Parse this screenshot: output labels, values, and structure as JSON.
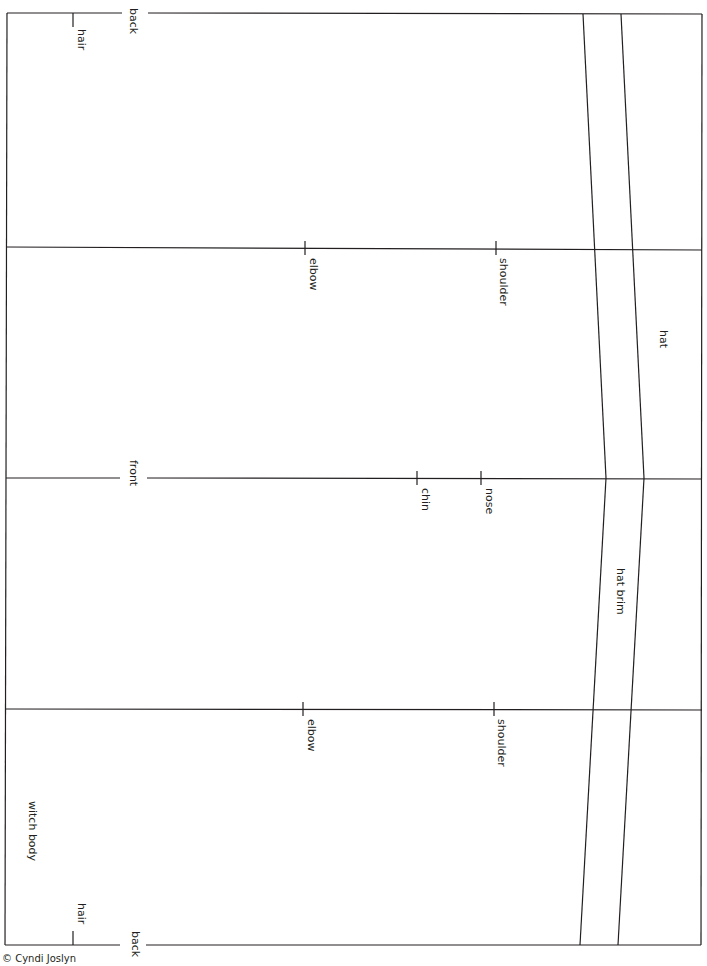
{
  "diagram": {
    "title": "witch body",
    "type": "paper doll pattern template",
    "line_color": "#231f20",
    "background": "#ffffff",
    "sections": [
      {
        "name": "back",
        "label": "back"
      },
      {
        "name": "front",
        "label": "front"
      },
      {
        "name": "back",
        "label": "back"
      }
    ],
    "markers": {
      "hair_top": "hair",
      "hair_bottom": "hair",
      "elbow_top": "elbow",
      "shoulder_top": "shoulder",
      "chin": "chin",
      "nose": "nose",
      "elbow_bottom": "elbow",
      "shoulder_bottom": "shoulder"
    },
    "regions": {
      "hat": "hat",
      "hat_brim": "hat brim",
      "body": "witch body"
    }
  },
  "footer": {
    "copyright": "© Cyndi Joslyn"
  }
}
